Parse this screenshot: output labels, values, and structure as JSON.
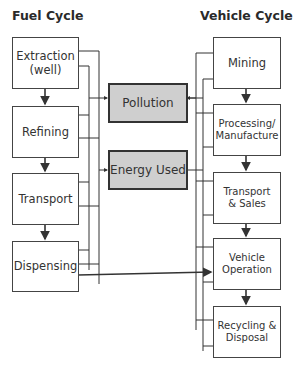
{
  "titles": {
    "fuel_cycle": "Fuel Cycle",
    "vehicle_cycle": "Vehicle Cycle"
  },
  "fuel_cycle": {
    "stages": [
      {
        "label": "Extraction\n(well)"
      },
      {
        "label": "Refining"
      },
      {
        "label": "Transport"
      },
      {
        "label": "Dispensing"
      }
    ]
  },
  "outputs": [
    {
      "label": "Pollution"
    },
    {
      "label": "Energy Used"
    }
  ],
  "vehicle_cycle": {
    "stages": [
      {
        "label": "Mining"
      },
      {
        "label": "Processing/\nManufacture"
      },
      {
        "label": "Transport\n& Sales"
      },
      {
        "label": "Vehicle\nOperation"
      },
      {
        "label": "Recycling &\nDisposal"
      }
    ]
  },
  "colors": {
    "output_fill": "#cfcfcf",
    "line": "#333333"
  }
}
